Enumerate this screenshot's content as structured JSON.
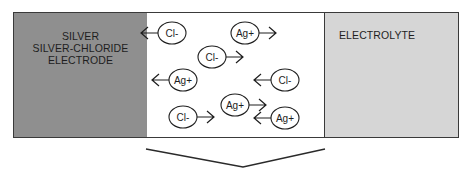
{
  "panels": {
    "left": {
      "lines": [
        "SILVER",
        "SILVER-CHLORIDE",
        "ELECTRODE"
      ],
      "fill": "#8f8f8f"
    },
    "middle": {
      "fill": "#ffffff"
    },
    "right": {
      "label": "ELECTROLYTE",
      "fill": "#d6d6d6"
    }
  },
  "ions": [
    {
      "label": "Cl-",
      "cx": 172,
      "cy": 33,
      "arrow": "left"
    },
    {
      "label": "Ag+",
      "cx": 245,
      "cy": 33,
      "arrow": "right"
    },
    {
      "label": "Cl-",
      "cx": 212,
      "cy": 57,
      "arrow": "right"
    },
    {
      "label": "Ag+",
      "cx": 183,
      "cy": 80,
      "arrow": "left"
    },
    {
      "label": "Cl-",
      "cx": 285,
      "cy": 80,
      "arrow": "left"
    },
    {
      "label": "Ag+",
      "cx": 235,
      "cy": 105,
      "arrow": "right"
    },
    {
      "label": "Cl-",
      "cx": 183,
      "cy": 117,
      "arrow": "right"
    },
    {
      "label": "Ag+",
      "cx": 285,
      "cy": 118,
      "arrow": "left"
    }
  ],
  "bracket": {
    "points": "146,149 243,167 325,149",
    "stroke": "#2a2a2a"
  },
  "border_color": "#3a3a3a"
}
